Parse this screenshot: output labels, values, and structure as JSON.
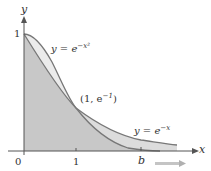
{
  "figure": {
    "axis_labels": {
      "x": "x",
      "y": "y"
    },
    "ticks": {
      "origin": "0",
      "x_one": "1",
      "x_b": "b",
      "y_one": "1"
    },
    "curves": [
      {
        "name": "gaussian",
        "label_prefix": "y = e",
        "label_exp": "−x²"
      },
      {
        "name": "exponential",
        "label_prefix": "y = e",
        "label_exp": "−x"
      }
    ],
    "intersection": {
      "label_prefix": "(1, e",
      "label_exp": "−1",
      "label_suffix": ")"
    },
    "colors": {
      "fill_exponential": "#d9d9d9",
      "fill_gaussian": "#c4c4c4",
      "curve_stroke": "#777777",
      "axis": "#555555",
      "arrow": "#bbbbbb"
    }
  }
}
